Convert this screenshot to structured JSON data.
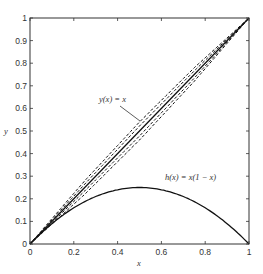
{
  "chart_data": {
    "type": "line",
    "title": "",
    "xlabel": "x",
    "ylabel": "y",
    "xlim": [
      0,
      1
    ],
    "ylim": [
      0,
      1
    ],
    "grid": false,
    "legend": null,
    "x_ticks": [
      "0",
      "0.2",
      "0.4",
      "0.6",
      "0.8",
      "1"
    ],
    "y_ticks": [
      "0",
      "0.1",
      "0.2",
      "0.3",
      "0.4",
      "0.5",
      "0.6",
      "0.7",
      "0.8",
      "0.9",
      "1"
    ],
    "series": [
      {
        "name": "y(x) = x",
        "style": "solid",
        "x": [
          0,
          1
        ],
        "y": [
          0,
          1
        ]
      },
      {
        "name": "h(x) = x(1 - x)",
        "style": "solid",
        "x": [
          0,
          0.1,
          0.2,
          0.3,
          0.4,
          0.5,
          0.6,
          0.7,
          0.8,
          0.9,
          1
        ],
        "y": [
          0,
          0.09,
          0.16,
          0.21,
          0.24,
          0.25,
          0.24,
          0.21,
          0.16,
          0.09,
          0
        ]
      },
      {
        "name": "dashed upper 2",
        "style": "dashed",
        "x": [
          0,
          0.25,
          0.5,
          0.75,
          1
        ],
        "y": [
          0,
          0.28,
          0.54,
          0.78,
          1
        ]
      },
      {
        "name": "dashed upper 1",
        "style": "dashed",
        "x": [
          0,
          0.25,
          0.5,
          0.75,
          1
        ],
        "y": [
          0,
          0.265,
          0.522,
          0.766,
          1
        ]
      },
      {
        "name": "dashed lower 1",
        "style": "dashed",
        "x": [
          0,
          0.25,
          0.5,
          0.75,
          1
        ],
        "y": [
          0,
          0.235,
          0.478,
          0.734,
          1
        ]
      },
      {
        "name": "dashed lower 2",
        "style": "dashed",
        "x": [
          0,
          0.25,
          0.5,
          0.75,
          1
        ],
        "y": [
          0,
          0.22,
          0.46,
          0.72,
          1
        ]
      }
    ],
    "annotations": [
      {
        "text": "y(x) = x",
        "x": 0.4,
        "y": 0.6,
        "arrow_to": [
          0.5,
          0.52
        ]
      },
      {
        "text": "h(x) = x(1 − x)",
        "x": 0.68,
        "y": 0.35
      }
    ]
  },
  "labels": {
    "xlabel": "x",
    "ylabel": "y",
    "annot_identity": "y(x) = x",
    "annot_h": "h(x) = x(1 − x)"
  },
  "colors": {
    "line": "#111111",
    "axis": "#333333",
    "background": "#ffffff"
  }
}
